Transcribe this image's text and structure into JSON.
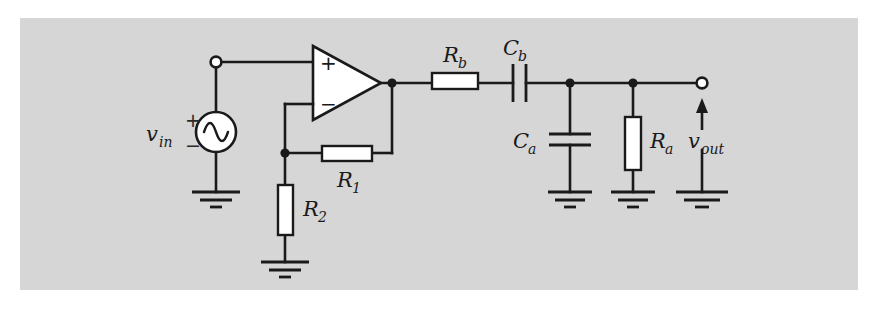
{
  "figure": {
    "kind": "circuit-schematic",
    "background_color": "#ffffff",
    "panel_color": "#d6d6d6",
    "wire_color": "#1a1a1a",
    "component_fill": "#ffffff",
    "label_color": "#1a1a1a"
  },
  "labels": {
    "v_in": {
      "base": "v",
      "sub": "in"
    },
    "v_out": {
      "base": "v",
      "sub": "out"
    },
    "r1": {
      "base": "R",
      "sub": "1"
    },
    "r2": {
      "base": "R",
      "sub": "2"
    },
    "ra": {
      "base": "R",
      "sub": "a"
    },
    "rb": {
      "base": "R",
      "sub": "b"
    },
    "ca": {
      "base": "C",
      "sub": "a"
    },
    "cb": {
      "base": "C",
      "sub": "b"
    }
  },
  "polarity": {
    "source_plus": "+",
    "source_minus": "−",
    "opamp_plus": "+",
    "opamp_minus": "−"
  },
  "components": [
    {
      "id": "v-in-source",
      "type": "ac-voltage-source",
      "label": "v_in"
    },
    {
      "id": "opamp",
      "type": "operational-amplifier",
      "label": ""
    },
    {
      "id": "r1-resistor",
      "type": "resistor",
      "label": "R_1",
      "orientation": "horizontal"
    },
    {
      "id": "r2-resistor",
      "type": "resistor",
      "label": "R_2",
      "orientation": "vertical"
    },
    {
      "id": "rb-resistor",
      "type": "resistor",
      "label": "R_b",
      "orientation": "horizontal"
    },
    {
      "id": "cb-capacitor",
      "type": "capacitor",
      "label": "C_b",
      "orientation": "vertical-plates"
    },
    {
      "id": "ca-capacitor",
      "type": "capacitor",
      "label": "C_a",
      "orientation": "horizontal-plates"
    },
    {
      "id": "ra-resistor",
      "type": "resistor",
      "label": "R_a",
      "orientation": "vertical"
    },
    {
      "id": "v-out-port",
      "type": "output-terminal",
      "label": "v_out"
    }
  ],
  "grounds": [
    {
      "id": "ground-source"
    },
    {
      "id": "ground-r2"
    },
    {
      "id": "ground-ca"
    },
    {
      "id": "ground-ra"
    },
    {
      "id": "ground-vout"
    }
  ]
}
